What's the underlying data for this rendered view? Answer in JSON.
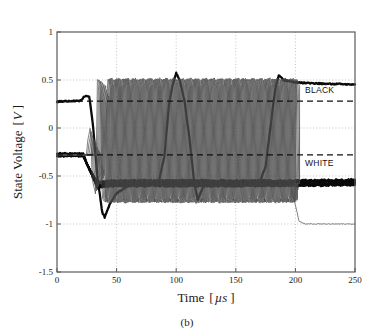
{
  "figure": {
    "caption": "(b)",
    "background_color": "#ffffff",
    "foreground_color": "#1a1a1a"
  },
  "chart_data": {
    "type": "line",
    "title": "",
    "subtitle": "",
    "xlabel": "Time",
    "xunit": "µs",
    "xlabel_full": "Time [µs ]",
    "ylabel": "State Voltage",
    "yunit": "V",
    "ylabel_full": "State Voltage [V ]",
    "xlim": [
      0,
      250
    ],
    "ylim": [
      -1.5,
      1.0
    ],
    "xticks": [
      0,
      50,
      100,
      150,
      200,
      250
    ],
    "xtick_labels": [
      "0",
      "50",
      "100",
      "150",
      "200",
      "250"
    ],
    "yticks": [
      1,
      0.5,
      0,
      -0.5,
      -1,
      -1.5
    ],
    "ytick_labels": [
      "1",
      "0.5",
      "0",
      "-0.5",
      "-1",
      "-1.5"
    ],
    "grid": true,
    "grid_style": "dotted",
    "grid_color": "#b4b4b4",
    "legend": "none",
    "annotations": [
      {
        "text": "BLACK",
        "x": 208,
        "y": 0.36,
        "name": "black-threshold-annotation"
      },
      {
        "text": "WHITE",
        "x": 208,
        "y": -0.4,
        "name": "white-threshold-annotation"
      }
    ],
    "threshold_lines": [
      {
        "name": "black-threshold",
        "value": 0.28,
        "style": "dashed",
        "color": "#111111",
        "width": 1.1
      },
      {
        "name": "white-threshold",
        "value": -0.28,
        "style": "dashed",
        "color": "#111111",
        "width": 1.1
      }
    ],
    "series": [
      {
        "name": "selected-cell-black-to-white",
        "role": "thick-trace",
        "color": "#0a0a0a",
        "width": 2.3,
        "start_level": 0.28,
        "oscillation": {
          "period": 8.4,
          "amplitude": 0.57,
          "low": -0.72
        },
        "events": [
          {
            "t": 0,
            "v": 0.275
          },
          {
            "t": 20,
            "v": 0.285
          },
          {
            "t": 23,
            "v": 0.33
          },
          {
            "t": 27,
            "v": 0.33
          },
          {
            "t": 30,
            "v": 0.05
          },
          {
            "t": 34,
            "v": -0.52
          },
          {
            "t": 38,
            "v": -0.88
          },
          {
            "t": 40,
            "v": -0.93
          },
          {
            "t": 44,
            "v": -0.8
          },
          {
            "t": 50,
            "v": -0.68
          },
          {
            "t": 60,
            "v": -0.6
          },
          {
            "t": 85,
            "v": -0.58
          },
          {
            "t": 90,
            "v": -0.3
          },
          {
            "t": 94,
            "v": 0.25
          },
          {
            "t": 97,
            "v": 0.45
          },
          {
            "t": 100,
            "v": 0.57
          },
          {
            "t": 103,
            "v": 0.5
          },
          {
            "t": 107,
            "v": 0.28
          },
          {
            "t": 111,
            "v": -0.1
          },
          {
            "t": 115,
            "v": -0.55
          },
          {
            "t": 118,
            "v": -0.75
          },
          {
            "t": 121,
            "v": -0.66
          },
          {
            "t": 124,
            "v": -0.58
          },
          {
            "t": 170,
            "v": -0.57
          },
          {
            "t": 175,
            "v": -0.4
          },
          {
            "t": 179,
            "v": 0.0
          },
          {
            "t": 183,
            "v": 0.4
          },
          {
            "t": 186,
            "v": 0.55
          },
          {
            "t": 190,
            "v": 0.5
          },
          {
            "t": 200,
            "v": 0.475
          },
          {
            "t": 225,
            "v": 0.46
          },
          {
            "t": 250,
            "v": 0.455
          }
        ]
      },
      {
        "name": "unselected-cells-white-band",
        "role": "thick-band",
        "color": "#0a0a0a",
        "width": 2.0,
        "count": 7,
        "start_level": -0.28,
        "settle_level": -0.575,
        "band_spread": 0.035,
        "transition_start": 22,
        "transition_end": 34,
        "noise_amplitude": 0.018
      },
      {
        "name": "oscillating-cells",
        "role": "thin-oscillators",
        "color": "#4a4a4a",
        "width": 0.7,
        "count": 9,
        "period": 8.4,
        "high": 0.52,
        "low": -0.78,
        "start_time": 24,
        "phase_spread": 8.4,
        "ramp_up_duration": 10
      },
      {
        "name": "cell-dropping-to-minus-one",
        "role": "thin-trace",
        "color": "#4a4a4a",
        "width": 0.7,
        "events": [
          {
            "t": 196,
            "v": -0.6
          },
          {
            "t": 200,
            "v": -0.8
          },
          {
            "t": 203,
            "v": -0.97
          },
          {
            "t": 208,
            "v": -1.0
          },
          {
            "t": 250,
            "v": -1.0
          }
        ]
      }
    ]
  }
}
